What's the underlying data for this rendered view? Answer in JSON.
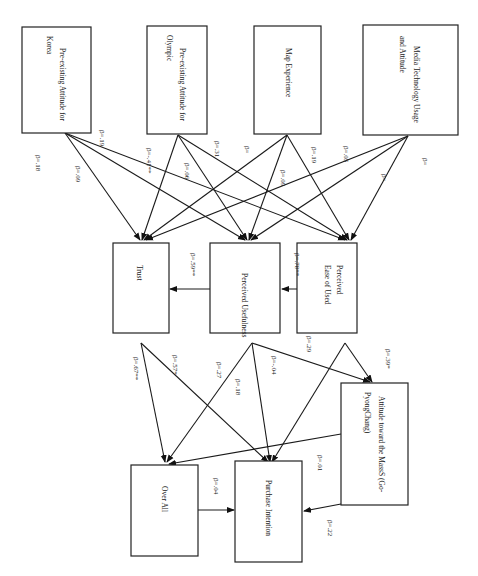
{
  "diagram": {
    "orientation": "rotated 90deg clockwise",
    "nodes": {
      "korea": {
        "line1": "Pre-existing  Attitude  for",
        "line2": "Korea"
      },
      "olympic": {
        "line1": "Pre-existing  Attitude  for",
        "line2": "Olympic"
      },
      "map": {
        "line1": "Map Experience",
        "line2": ""
      },
      "media": {
        "line1": "Media  Technology  Usage",
        "line2": "and Attitude"
      },
      "trust": {
        "line1": "Trust",
        "line2": ""
      },
      "usefulness": {
        "line1": "Perceived Usefulness",
        "line2": ""
      },
      "ease": {
        "line1": "Perceived",
        "line2": "Ease of Used"
      },
      "attitude_mass": {
        "line1": "Attitude  toward  the MassS  (Go-",
        "line2": "PyongChang)"
      },
      "overall": {
        "line1": "Over All",
        "line2": ""
      },
      "purchase": {
        "line1": "Purchase Intention",
        "line2": ""
      }
    },
    "labels": {
      "korea_a": "β=.18",
      "korea_b": "β=.09",
      "korea_c": "β=.19",
      "olympic_a": "β=-.41**",
      "olympic_b": "β=.06",
      "olympic_c": "β=.31",
      "map_a": "β=",
      "map_b": "β=.09",
      "map_c": "β=.19",
      "media_a": "β=.05",
      "media_b": "β=",
      "media_c": "β=",
      "useful_trust": "β=.59**",
      "ease_useful": "β=.78**",
      "ease_low": "β=.29",
      "ease_att": "β=.39*",
      "trust_over": "β=.67**",
      "trust_pur": "β=.57*",
      "useful_over": "β=.27",
      "useful_pur_a": "β=.18",
      "useful_pur_b": "β=-.04",
      "att_pur": "β=.01",
      "over_pur": "β=.04",
      "att_pur_b": "β=.22"
    }
  }
}
